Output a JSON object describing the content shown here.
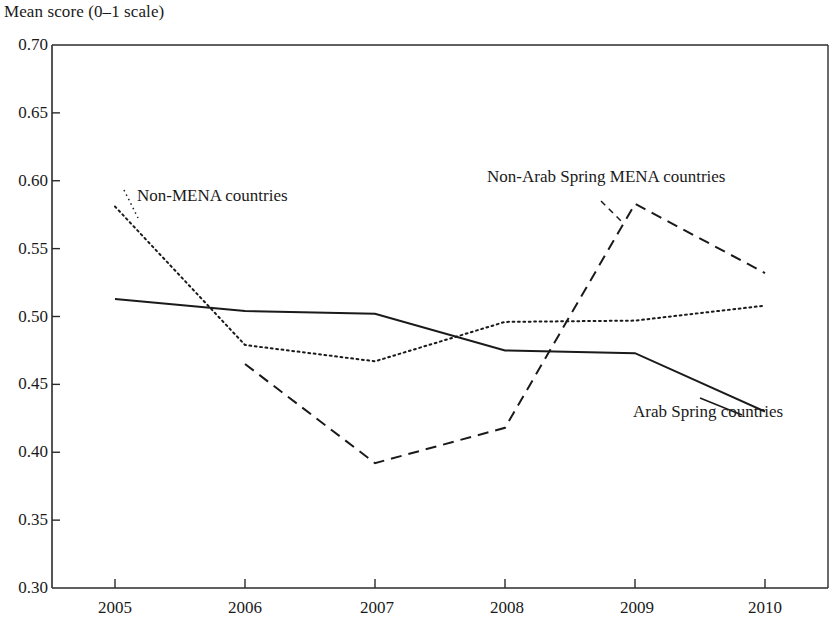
{
  "chart_data": {
    "type": "line",
    "title": "Mean score (0–1 scale)",
    "xlabel": "",
    "ylabel": "Mean score (0–1 scale)",
    "x": [
      2005,
      2006,
      2007,
      2008,
      2009,
      2010
    ],
    "xtick_labels": [
      "2005",
      "2006",
      "2007",
      "2008",
      "2009",
      "2010"
    ],
    "ytick_labels": [
      "0.70",
      "0.65",
      "0.60",
      "0.55",
      "0.50",
      "0.45",
      "0.40",
      "0.35",
      "0.30"
    ],
    "ytick_values": [
      0.7,
      0.65,
      0.6,
      0.55,
      0.5,
      0.45,
      0.4,
      0.35,
      0.3
    ],
    "ylim": [
      0.3,
      0.7
    ],
    "xlim": [
      2005,
      2010
    ],
    "grid": false,
    "legend_position": "inline-annotations",
    "line_color": "#1a1a1a",
    "series": [
      {
        "name": "Non-MENA countries",
        "style": "dotted",
        "x": [
          2005,
          2006,
          2007,
          2008,
          2009,
          2010
        ],
        "values": [
          0.581,
          0.479,
          0.467,
          0.496,
          0.497,
          0.508
        ]
      },
      {
        "name": "Non-Arab Spring MENA countries",
        "style": "dashed",
        "x": [
          2006,
          2007,
          2008,
          2009,
          2010
        ],
        "values": [
          0.465,
          0.392,
          0.418,
          0.583,
          0.532
        ]
      },
      {
        "name": "Arab Spring countries",
        "style": "solid",
        "x": [
          2005,
          2006,
          2007,
          2008,
          2009,
          2010
        ],
        "values": [
          0.513,
          0.504,
          0.502,
          0.475,
          0.473,
          0.43
        ]
      }
    ],
    "annotations": [
      {
        "text": "Non-MENA countries",
        "x": 137,
        "y": 196
      },
      {
        "text": "Non-Arab Spring MENA countries",
        "x": 487,
        "y": 177
      },
      {
        "text": "Arab Spring countries",
        "x": 633,
        "y": 412
      }
    ]
  }
}
